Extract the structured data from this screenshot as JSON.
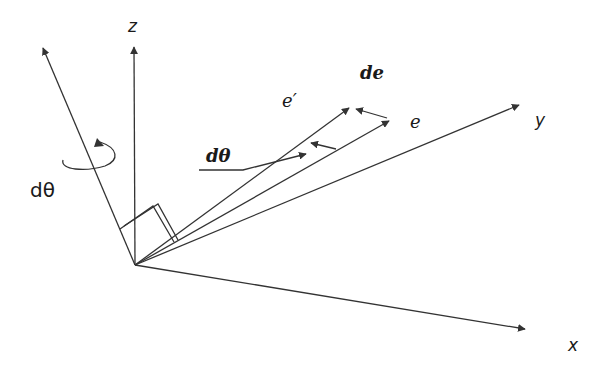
{
  "diagram": {
    "colors": {
      "stroke": "#333333",
      "background": "#ffffff",
      "text": "#1a1a1a"
    },
    "origin": [
      135,
      265
    ],
    "axes": {
      "x": {
        "label": "x",
        "tip": [
          527,
          330
        ]
      },
      "y": {
        "label": "y",
        "tip": [
          521,
          104
        ]
      },
      "z": {
        "label": "z",
        "tip": [
          134,
          45
        ]
      }
    },
    "rotation_axis": {
      "label": "dθ",
      "tip": [
        42,
        45
      ]
    },
    "vectors": {
      "e": {
        "label": "e",
        "tip": [
          390,
          120
        ]
      },
      "e_prime": {
        "label": "e′",
        "tip": [
          350,
          107
        ]
      },
      "de": {
        "label": "de",
        "from": [
          388,
          118
        ],
        "to": [
          355,
          108
        ]
      }
    },
    "angle_annotation": {
      "label": "dθ"
    }
  }
}
